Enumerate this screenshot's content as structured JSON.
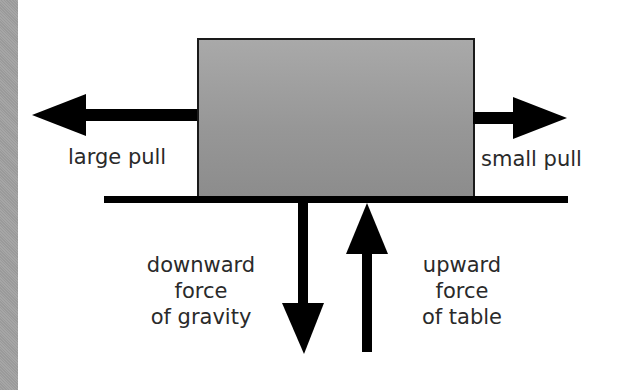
{
  "diagram": {
    "labels": {
      "large_pull": "large pull",
      "small_pull": "small pull",
      "gravity": [
        "downward",
        "force",
        "of gravity"
      ],
      "table": [
        "upward",
        "force",
        "of table"
      ]
    },
    "colors": {
      "box_top": "#a9a9a9",
      "box_bottom": "#8c8c8c",
      "arrow": "#000000",
      "text": "#2a2a2a",
      "strip": "#a0a0a0"
    }
  }
}
